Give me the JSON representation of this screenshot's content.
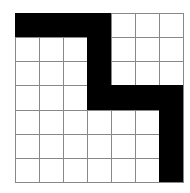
{
  "grid": {
    "rows": 7,
    "cols": 7,
    "fill_color": "#000000",
    "empty_color": "#ffffff",
    "line_color": "#888888",
    "cells": [
      [
        1,
        1,
        1,
        1,
        0,
        0,
        0
      ],
      [
        0,
        0,
        0,
        1,
        0,
        0,
        0
      ],
      [
        0,
        0,
        0,
        1,
        0,
        0,
        0
      ],
      [
        0,
        0,
        0,
        1,
        1,
        1,
        1
      ],
      [
        0,
        0,
        0,
        0,
        0,
        0,
        1
      ],
      [
        0,
        0,
        0,
        0,
        0,
        0,
        1
      ],
      [
        0,
        0,
        0,
        0,
        0,
        0,
        1
      ]
    ]
  }
}
